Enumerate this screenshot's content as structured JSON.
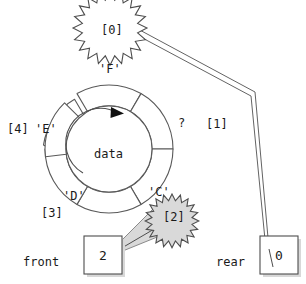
{
  "figure": {
    "center_label": "data"
  },
  "ring": {
    "center_x": 109,
    "center_y": 149,
    "outer_radius": 64,
    "inner_radius": 43,
    "rotation_arrow": "clockwise-arrow-icon",
    "slots": [
      {
        "index_label": "[0]",
        "value_label": "",
        "highlighted": true,
        "position": "top"
      },
      {
        "index_label": "[1]",
        "value_label": "?",
        "highlighted": false,
        "position": "upper-right"
      },
      {
        "index_label": "[2]",
        "value_label": "'C'",
        "highlighted": true,
        "position": "lower-right"
      },
      {
        "index_label": "[3]",
        "value_label": "'D'",
        "highlighted": false,
        "position": "lower-left"
      },
      {
        "index_label": "[4]",
        "value_label": "'E'",
        "highlighted": false,
        "position": "left"
      },
      {
        "index_label": "",
        "value_label": "'F'",
        "highlighted": false,
        "position": "upper-left"
      }
    ]
  },
  "callouts": {
    "rear_star": {
      "label": "[0]",
      "fill": "#ffffff"
    },
    "front_star": {
      "label": "[2]",
      "fill": "#d9d9d9"
    }
  },
  "pointers": {
    "front": {
      "name_label": "front",
      "value": "2"
    },
    "rear": {
      "name_label": "rear",
      "value": "0"
    }
  },
  "colors": {
    "stroke": "#4d4d4d",
    "text": "#1a1a1a",
    "shadow": "#d0d0d0",
    "star_gray": "#d9d9d9",
    "white": "#ffffff"
  }
}
